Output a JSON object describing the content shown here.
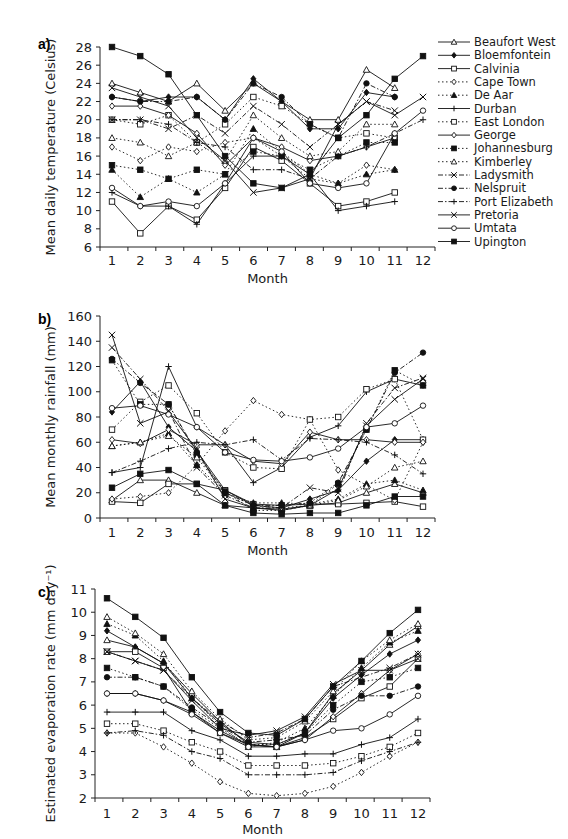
{
  "page": {
    "header_fragment": "3 | Data Pilot"
  },
  "legend": {
    "entries": [
      {
        "name": "Beaufort West",
        "marker": "triangle-open",
        "dash": "solid"
      },
      {
        "name": "Bloemfontein",
        "marker": "diamond-filled",
        "dash": "solid"
      },
      {
        "name": "Calvinia",
        "marker": "square-open",
        "dash": "solid"
      },
      {
        "name": "Cape Town",
        "marker": "diamond-open",
        "dash": "dotted"
      },
      {
        "name": "De Aar",
        "marker": "triangle-filled",
        "dash": "dotted"
      },
      {
        "name": "Durban",
        "marker": "plus",
        "dash": "solid"
      },
      {
        "name": "East London",
        "marker": "square-open",
        "dash": "dotted"
      },
      {
        "name": "George",
        "marker": "diamond-open",
        "dash": "solid"
      },
      {
        "name": "Johannesburg",
        "marker": "square-filled",
        "dash": "dotted"
      },
      {
        "name": "Kimberley",
        "marker": "triangle-open",
        "dash": "dotted"
      },
      {
        "name": "Ladysmith",
        "marker": "cross",
        "dash": "dashdot"
      },
      {
        "name": "Nelspruit",
        "marker": "circle-filled",
        "dash": "dashdot"
      },
      {
        "name": "Port Elizabeth",
        "marker": "plus",
        "dash": "dashdot"
      },
      {
        "name": "Pretoria",
        "marker": "cross",
        "dash": "solid"
      },
      {
        "name": "Umtata",
        "marker": "circle-open",
        "dash": "solid"
      },
      {
        "name": "Upington",
        "marker": "square-filled",
        "dash": "solid"
      }
    ]
  },
  "chart_data": [
    {
      "panel": "a)",
      "type": "line",
      "title": "",
      "xlabel": "Month",
      "ylabel": "Mean daily temperature (Celsius)",
      "x": [
        1,
        2,
        3,
        4,
        5,
        6,
        7,
        8,
        9,
        10,
        11,
        12
      ],
      "ylim": [
        6,
        28
      ],
      "yticks": [
        6,
        8,
        10,
        12,
        14,
        16,
        18,
        20,
        22,
        24,
        26,
        28
      ],
      "grid": false,
      "legend_position": "right",
      "series": [
        {
          "name": "Beaufort West",
          "values": [
            24,
            23,
            22,
            24,
            21,
            24,
            22,
            20,
            20,
            25.5,
            23.5,
            null
          ]
        },
        {
          "name": "Bloemfontein",
          "values": [
            22.5,
            22,
            22.5,
            22.5,
            20,
            24.5,
            22,
            19,
            19,
            23,
            22.5,
            null
          ]
        },
        {
          "name": "Calvinia",
          "values": [
            11,
            7.5,
            10.5,
            9,
            12.5,
            17,
            15.5,
            13,
            10.5,
            11,
            12,
            null
          ]
        },
        {
          "name": "Cape Town",
          "values": [
            17,
            15.5,
            17,
            16.5,
            17.5,
            18,
            16,
            13.5,
            13,
            15,
            14.5,
            null
          ]
        },
        {
          "name": "De Aar",
          "values": [
            14.5,
            11.5,
            13.5,
            12,
            14,
            19,
            16.5,
            14,
            13,
            14,
            14.5,
            null
          ]
        },
        {
          "name": "Durban",
          "values": [
            12,
            10.5,
            10.5,
            8.5,
            13,
            16,
            16,
            14,
            10,
            10.5,
            11,
            null
          ]
        },
        {
          "name": "East London",
          "values": [
            20,
            19.5,
            20.5,
            17.5,
            19.5,
            22.5,
            21.5,
            19.5,
            18,
            18.5,
            18,
            null
          ]
        },
        {
          "name": "George",
          "values": [
            21.5,
            21.5,
            20.5,
            18.5,
            15,
            18,
            17,
            15.5,
            16,
            17,
            18,
            null
          ]
        },
        {
          "name": "Johannesburg",
          "values": [
            15,
            14.5,
            13.5,
            14.5,
            14,
            16.5,
            16,
            14.5,
            16,
            17.5,
            17.5,
            null
          ]
        },
        {
          "name": "Kimberley",
          "values": [
            18,
            17.5,
            16,
            17.5,
            15.5,
            20.5,
            18,
            16,
            16.5,
            19.5,
            19.5,
            null
          ]
        },
        {
          "name": "Ladysmith",
          "values": [
            20,
            20,
            19,
            20.5,
            18.5,
            21.5,
            19.5,
            17,
            19.5,
            22,
            21,
            null
          ]
        },
        {
          "name": "Nelspruit",
          "values": [
            22.5,
            22,
            22,
            22.5,
            20,
            24,
            22.5,
            19.5,
            18,
            24,
            22.5,
            null
          ]
        },
        {
          "name": "Port Elizabeth",
          "values": [
            20,
            20,
            19.5,
            17.5,
            17,
            14.5,
            14.5,
            13.5,
            16,
            17,
            18.5,
            20
          ]
        },
        {
          "name": "Pretoria",
          "values": [
            23.5,
            22.5,
            21.5,
            18,
            15.5,
            12,
            12.5,
            13.5,
            19.5,
            22,
            20.5,
            22.5
          ]
        },
        {
          "name": "Umtata",
          "values": [
            12.5,
            10.5,
            11,
            10.5,
            13,
            18,
            16.5,
            13,
            12.5,
            13,
            18.5,
            21
          ]
        },
        {
          "name": "Upington",
          "values": [
            28,
            27,
            25,
            20.5,
            16,
            13,
            12.5,
            14,
            18,
            20.5,
            24.5,
            27
          ]
        }
      ]
    },
    {
      "panel": "b)",
      "type": "line",
      "title": "",
      "xlabel": "Month",
      "ylabel": "Mean monthly rainfall (mm)",
      "x": [
        1,
        2,
        3,
        4,
        5,
        6,
        7,
        8,
        9,
        10,
        11,
        12
      ],
      "ylim": [
        0,
        160
      ],
      "yticks": [
        0,
        20,
        40,
        60,
        80,
        100,
        120,
        140,
        160
      ],
      "grid": false,
      "series": [
        {
          "name": "Beaufort West",
          "values": [
            14,
            30,
            30,
            20,
            10,
            8,
            7,
            10,
            12,
            20,
            27,
            20
          ]
        },
        {
          "name": "Bloemfontein",
          "values": [
            84,
            108,
            72,
            53,
            22,
            10,
            8,
            15,
            22,
            45,
            62,
            62
          ]
        },
        {
          "name": "Calvinia",
          "values": [
            13,
            12,
            27,
            27,
            22,
            11,
            10,
            11,
            11,
            12,
            13,
            9
          ]
        },
        {
          "name": "Cape Town",
          "values": [
            15,
            17,
            20,
            42,
            69,
            93,
            82,
            78,
            38,
            26,
            14,
            60
          ]
        },
        {
          "name": "De Aar",
          "values": [
            57,
            60,
            67,
            42,
            20,
            12,
            12,
            11,
            15,
            27,
            30,
            22
          ]
        },
        {
          "name": "Durban",
          "values": [
            36,
            40,
            120,
            72,
            58,
            28,
            40,
            64,
            73,
            100,
            110,
            105
          ]
        },
        {
          "name": "East London",
          "values": [
            70,
            92,
            105,
            83,
            52,
            40,
            39,
            78,
            80,
            102,
            110,
            62
          ]
        },
        {
          "name": "George",
          "values": [
            62,
            59,
            70,
            58,
            58,
            45,
            43,
            68,
            62,
            62,
            60,
            60
          ]
        },
        {
          "name": "Johannesburg",
          "values": [
            125,
            90,
            90,
            50,
            21,
            6,
            6,
            10,
            27,
            70,
            117,
            105
          ]
        },
        {
          "name": "Kimberley",
          "values": [
            57,
            60,
            65,
            48,
            20,
            10,
            8,
            10,
            14,
            25,
            40,
            45
          ]
        },
        {
          "name": "Ladysmith",
          "values": [
            135,
            110,
            85,
            40,
            18,
            8,
            8,
            24,
            20,
            75,
            103,
            111
          ]
        },
        {
          "name": "Nelspruit",
          "values": [
            126,
            107,
            90,
            52,
            20,
            10,
            10,
            12,
            28,
            70,
            115,
            131
          ]
        },
        {
          "name": "Port Elizabeth",
          "values": [
            36,
            45,
            55,
            60,
            58,
            62,
            46,
            63,
            62,
            60,
            50,
            35
          ]
        },
        {
          "name": "Pretoria",
          "values": [
            145,
            75,
            84,
            54,
            15,
            8,
            6,
            10,
            23,
            73,
            94,
            110
          ]
        },
        {
          "name": "Umtata",
          "values": [
            87,
            89,
            82,
            72,
            52,
            46,
            45,
            48,
            55,
            72,
            75,
            89
          ]
        },
        {
          "name": "Upington",
          "values": [
            24,
            35,
            38,
            27,
            10,
            4,
            3,
            4,
            4,
            10,
            17,
            17
          ]
        }
      ]
    },
    {
      "panel": "c)",
      "type": "line",
      "title": "",
      "xlabel": "Month",
      "ylabel": "Estimated evaporation rate (mm day⁻¹)",
      "x": [
        1,
        2,
        3,
        4,
        5,
        6,
        7,
        8,
        9,
        10,
        11,
        12
      ],
      "ylim": [
        2,
        11
      ],
      "yticks": [
        2,
        3,
        4,
        5,
        6,
        7,
        8,
        9,
        10,
        11
      ],
      "grid": false,
      "series": [
        {
          "name": "Beaufort West",
          "values": [
            8.8,
            8.5,
            7.8,
            6.5,
            5.3,
            4.3,
            4.2,
            4.8,
            6.5,
            7.5,
            8.6,
            9.4
          ]
        },
        {
          "name": "Bloemfontein",
          "values": [
            9.2,
            8.5,
            7.8,
            6.3,
            5.2,
            4.4,
            4.3,
            4.8,
            6.3,
            7.3,
            8.2,
            8.8
          ]
        },
        {
          "name": "Calvinia",
          "values": [
            8.3,
            8.3,
            7.6,
            5.7,
            4.8,
            4.3,
            4.2,
            4.6,
            5.4,
            6.3,
            6.8,
            8.0
          ]
        },
        {
          "name": "Cape Town",
          "values": [
            4.8,
            4.8,
            4.2,
            3.5,
            2.7,
            2.2,
            2.1,
            2.2,
            2.5,
            3.1,
            3.8,
            4.4
          ]
        },
        {
          "name": "De Aar",
          "values": [
            9.5,
            9.0,
            7.9,
            6.3,
            5.1,
            4.2,
            4.4,
            5.0,
            6.4,
            7.6,
            8.7,
            9.2
          ]
        },
        {
          "name": "Durban",
          "values": [
            5.7,
            5.7,
            5.7,
            4.9,
            4.5,
            3.8,
            3.8,
            3.9,
            3.9,
            4.3,
            4.6,
            5.4
          ]
        },
        {
          "name": "East London",
          "values": [
            5.2,
            5.2,
            4.9,
            4.4,
            4.0,
            3.4,
            3.4,
            3.4,
            3.5,
            3.8,
            4.2,
            4.8
          ]
        },
        {
          "name": "George",
          "values": [
            6.5,
            6.5,
            6.2,
            5.7,
            4.9,
            4.3,
            4.2,
            4.5,
            5.5,
            6.5,
            7.5,
            8.2
          ]
        },
        {
          "name": "Johannesburg",
          "values": [
            7.6,
            7.2,
            6.8,
            5.8,
            5.0,
            4.3,
            4.3,
            4.8,
            6.0,
            7.0,
            7.2,
            7.6
          ]
        },
        {
          "name": "Kimberley",
          "values": [
            9.8,
            9.1,
            8.2,
            6.6,
            5.4,
            4.5,
            4.6,
            5.3,
            6.6,
            7.9,
            8.8,
            9.5
          ]
        },
        {
          "name": "Ladysmith",
          "values": [
            8.3,
            7.9,
            7.5,
            6.3,
            5.3,
            4.6,
            4.8,
            5.4,
            6.8,
            7.2,
            7.6,
            8.2
          ]
        },
        {
          "name": "Nelspruit",
          "values": [
            7.2,
            7.2,
            6.8,
            5.9,
            5.1,
            4.4,
            4.5,
            4.7,
            5.8,
            6.4,
            6.4,
            6.8
          ]
        },
        {
          "name": "Port Elizabeth",
          "values": [
            4.8,
            4.9,
            4.7,
            4.0,
            3.7,
            3.0,
            3.0,
            3.0,
            3.1,
            3.6,
            4.0,
            4.4
          ]
        },
        {
          "name": "Pretoria",
          "values": [
            8.3,
            7.9,
            7.5,
            6.2,
            5.0,
            4.7,
            4.9,
            5.5,
            6.9,
            7.5,
            7.5,
            8.0
          ]
        },
        {
          "name": "Umtata",
          "values": [
            6.5,
            6.5,
            6.2,
            5.6,
            4.8,
            4.2,
            4.2,
            4.5,
            4.9,
            5.0,
            5.6,
            6.4
          ]
        },
        {
          "name": "Upington",
          "values": [
            10.6,
            9.8,
            8.9,
            7.2,
            5.7,
            4.8,
            4.7,
            5.4,
            6.8,
            7.9,
            9.1,
            10.1
          ]
        }
      ]
    }
  ]
}
